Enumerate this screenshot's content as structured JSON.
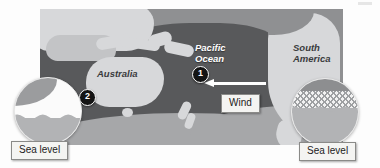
{
  "figure": {
    "type": "map-diagram",
    "background_color": "#fdfdfd"
  },
  "map": {
    "ocean_color": "#58595b",
    "land_color": "#d7d8da",
    "frame_color": "#8f9092",
    "labels": [
      {
        "id": "pacific-ocean",
        "text": "Pacific\nOcean",
        "line1": "Pacific",
        "line2": "Ocean",
        "style": "italic-white"
      },
      {
        "id": "south-america",
        "text": "South\nAmerica",
        "line1": "South",
        "line2": "America",
        "style": "italic-dark"
      },
      {
        "id": "australia",
        "text": "Australia",
        "line1": "Australia",
        "style": "italic-dark"
      }
    ]
  },
  "wind": {
    "label": "Wind",
    "arrow_direction": "left",
    "arrow_color": "#ffffff"
  },
  "markers": [
    {
      "id": "marker-1",
      "number": "1"
    },
    {
      "id": "marker-2",
      "number": "2"
    }
  ],
  "insets": [
    {
      "id": "inset-left",
      "caption": "Sea level",
      "description": "lower sea level cross-section over Australia",
      "water_band": "none",
      "seafloor_color": "#b2b3b5"
    },
    {
      "id": "inset-right",
      "caption": "Sea level",
      "description": "raised hatched sea level cross-section near South America",
      "water_band": "hatched",
      "seafloor_color": "#b2b3b5"
    }
  ],
  "colors": {
    "ocean": "#58595b",
    "land": "#d7d8da",
    "southern_band": "#a6a7a9",
    "marker_fill": "#141414",
    "marker_text": "#ffffff",
    "label_box_bg": "#f4f4f2",
    "label_box_border": "#8a8a88"
  }
}
